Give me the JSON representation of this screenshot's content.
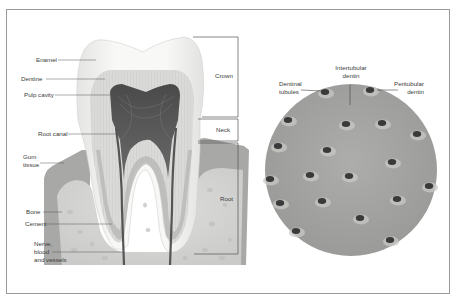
{
  "tooth_diagram": {
    "labels": {
      "enamel": "Enamel",
      "dentine": "Dentine",
      "pulp_cavity": "Pulp cavity",
      "root_canal": "Root canal",
      "gum_tissue_line1": "Gum",
      "gum_tissue_line2": "tissue",
      "bone": "Bone",
      "cement": "Cement",
      "nerve_line1": "Nerve,",
      "nerve_line2": "blood",
      "nerve_line3": "and vessels"
    },
    "regions": {
      "crown": "Crown",
      "neck": "Neck",
      "root": "Root"
    }
  },
  "dentin_detail": {
    "labels": {
      "intertubular_line1": "Intertubular",
      "intertubular_line2": "dentin",
      "dentinal_tubules_line1": "Dentinal",
      "dentinal_tubules_line2": "tubules",
      "peritubular_line1": "Peritubular",
      "peritubular_line2": "dentin"
    }
  },
  "colors": {
    "enamel": "#f4f4f2",
    "dentine": "#dcdcda",
    "pulp": "#5c5c5c",
    "gum": "#a9a9a9",
    "bone": "#d2d2d0",
    "dentin_disc": "#a2a2a2",
    "tubule": "#3a3a3a",
    "leader_line": "#555555",
    "frame": "#9a9a9a"
  }
}
